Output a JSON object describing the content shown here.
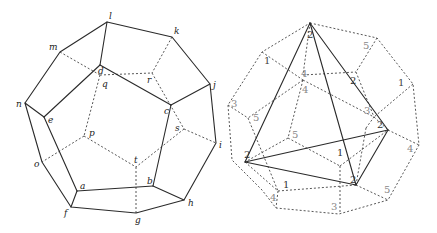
{
  "figures": [
    {
      "id": "left",
      "description": "Dodecahedron with lettered vertices",
      "vertex_labels": [
        "a",
        "b",
        "c",
        "d",
        "e",
        "f",
        "g",
        "h",
        "i",
        "j",
        "k",
        "l",
        "m",
        "n",
        "o",
        "p",
        "q",
        "r",
        "s",
        "t"
      ]
    },
    {
      "id": "right",
      "description": "Dodecahedron (dashed) with inscribed tetrahedron (solid) and numbered faces",
      "face_numbers": [
        {
          "label": "1",
          "color": "#444444"
        },
        {
          "label": "5",
          "color": "#888888"
        },
        {
          "label": "4",
          "color": "#888888"
        },
        {
          "label": "4",
          "color": "#888888"
        },
        {
          "label": "2",
          "color": "#333333"
        },
        {
          "label": "1",
          "color": "#444444"
        },
        {
          "label": "3",
          "color": "#888888"
        },
        {
          "label": "3",
          "color": "#888888"
        },
        {
          "label": "5",
          "color": "#888888"
        },
        {
          "label": "5",
          "color": "#888888"
        },
        {
          "label": "2",
          "color": "#333333"
        },
        {
          "label": "2",
          "color": "#333333"
        },
        {
          "label": "1",
          "color": "#333333"
        },
        {
          "label": "4",
          "color": "#888888"
        },
        {
          "label": "2",
          "color": "#333333"
        },
        {
          "label": "1",
          "color": "#333333"
        },
        {
          "label": "4",
          "color": "#888888"
        },
        {
          "label": "5",
          "color": "#888888"
        },
        {
          "label": "3",
          "color": "#888888"
        },
        {
          "label": "2",
          "color": "#333333"
        }
      ]
    }
  ],
  "labels": {
    "a": "a",
    "b": "b",
    "c": "c",
    "d": "d",
    "e": "e",
    "f": "f",
    "g": "g",
    "h": "h",
    "i": "i",
    "j": "j",
    "k": "k",
    "l": "l",
    "m": "m",
    "n": "n",
    "o": "o",
    "p": "p",
    "q": "q",
    "r": "r",
    "s": "s",
    "t": "t"
  }
}
